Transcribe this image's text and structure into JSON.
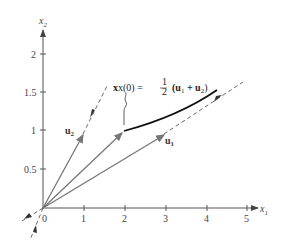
{
  "diagram": {
    "axes": {
      "x_label": "x",
      "x_sub": "1",
      "y_label": "x",
      "y_sub": "2",
      "x_ticks": [
        "0",
        "1",
        "2",
        "3",
        "4",
        "5"
      ],
      "y_ticks": [
        "0.5",
        "1",
        "1.5",
        "2"
      ]
    },
    "vectors": {
      "u1": {
        "label": "u",
        "sub": "1",
        "components": [
          3,
          1
        ]
      },
      "u2": {
        "label": "u",
        "sub": "2",
        "components": [
          1,
          1
        ]
      },
      "sum_half": {
        "components": [
          2,
          1
        ]
      }
    },
    "annotation": {
      "lhs": "x(0) = ",
      "frac_num": "1",
      "frac_den": "2",
      "rhs_open": "(u",
      "rhs_sub1": "1",
      "rhs_plus": " + u",
      "rhs_sub2": "2",
      "rhs_close": ")"
    },
    "colors": {
      "vector": "#777777",
      "axis": "#444444",
      "trajectory": "#111111"
    }
  }
}
